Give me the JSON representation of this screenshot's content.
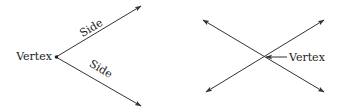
{
  "colors": {
    "line": "#333333",
    "text": "#222222",
    "background": "#ffffff"
  },
  "left_diagram": {
    "vertex_label": "Vertex",
    "upper_side_label": "Side",
    "lower_side_label": "Side"
  },
  "right_diagram": {
    "vertex_label": "Vertex"
  }
}
